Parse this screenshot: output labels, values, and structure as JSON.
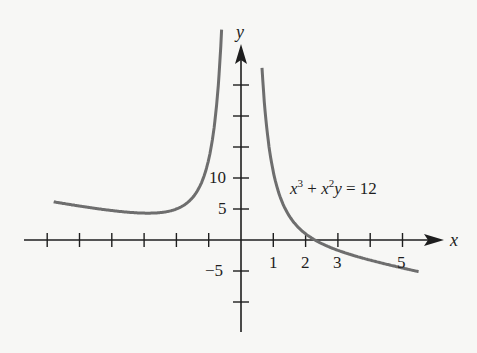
{
  "chart_data": {
    "type": "line",
    "title": "",
    "equation": "x^3 + x^2 y = 12",
    "xlabel": "x",
    "ylabel": "y",
    "xlim": [
      -6.1,
      6.3
    ],
    "ylim": [
      -12.5,
      31
    ],
    "x_tick_values": [
      -6,
      -5,
      -4,
      -3,
      -2,
      -1,
      1,
      2,
      3,
      4,
      5
    ],
    "x_tick_labels": [
      {
        "value": 1,
        "label": "1"
      },
      {
        "value": 2,
        "label": "2"
      },
      {
        "value": 3,
        "label": "3"
      },
      {
        "value": 5,
        "label": "5"
      }
    ],
    "y_tick_values": [
      -10,
      -5,
      5,
      10,
      15,
      20,
      25
    ],
    "y_tick_labels": [
      {
        "value": 10,
        "label": "10"
      },
      {
        "value": 5,
        "label": "5"
      },
      {
        "value": -5,
        "label": "−5"
      }
    ],
    "grid": false,
    "series": [
      {
        "name": "left branch",
        "function": "y = (12 - x^3) / x^2",
        "x_range": [
          -5.8,
          -0.6
        ]
      },
      {
        "name": "right branch",
        "function": "y = (12 - x^3) / x^2",
        "x_range": [
          0.65,
          5.5
        ]
      }
    ],
    "annotations": [
      {
        "text": "x³ + x²y = 12",
        "x": 1.5,
        "y": 9.5
      }
    ],
    "curve_color": "#6e6e6e",
    "axis_color": "#1e1e1e"
  },
  "labels": {
    "x_axis": "x",
    "y_axis": "y",
    "tick_1": "1",
    "tick_2": "2",
    "tick_3": "3",
    "tick_5": "5",
    "tick_10": "10",
    "tick_y5": "5",
    "tick_ym5": "−5",
    "eq_x": "x",
    "eq_3": "3",
    "eq_plus": " + ",
    "eq_x2": "x",
    "eq_2": "2",
    "eq_y": "y",
    "eq_rhs": " = 12"
  }
}
